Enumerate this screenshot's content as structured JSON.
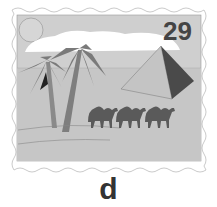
{
  "stamp": {
    "denomination": "29",
    "scene": "desert with palm trees, pyramid and three camels",
    "colors": {
      "sky": "#cfcfcf",
      "sand": "#c8c8c8",
      "cloud": "#ffffff",
      "palm_leaf": "#7a7a7a",
      "palm_trunk": "#8a8a8a",
      "pyramid_light": "#c4c4c4",
      "pyramid_dark": "#4a4a4a",
      "camel": "#5a5a5a",
      "denomination": "#444444"
    }
  },
  "caption": "d"
}
